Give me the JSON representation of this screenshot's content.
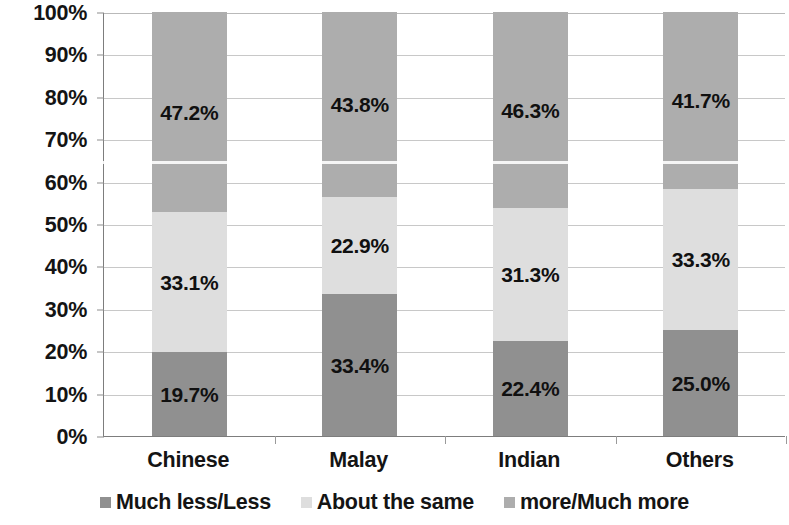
{
  "chart_data": {
    "type": "bar",
    "subtype": "stacked-100-percent",
    "title": "",
    "subtitle": "",
    "xlabel": "",
    "ylabel": "",
    "ylim": [
      0,
      100
    ],
    "y_tick_labels": [
      "0%",
      "10%",
      "20%",
      "30%",
      "40%",
      "50%",
      "60%",
      "70%",
      "80%",
      "90%",
      "100%"
    ],
    "y_tick_values": [
      0,
      10,
      20,
      30,
      40,
      50,
      60,
      70,
      80,
      90,
      100
    ],
    "grid": true,
    "legend_position": "bottom",
    "categories": [
      "Chinese",
      "Malay",
      "Indian",
      "Others"
    ],
    "series": [
      {
        "name": "Much less/Less",
        "color": "#909090",
        "values": [
          19.7,
          33.4,
          22.4,
          25.0
        ],
        "labels": [
          "19.7%",
          "33.4%",
          "22.4%",
          "25.0%"
        ]
      },
      {
        "name": "About the same",
        "color": "#dedede",
        "values": [
          33.1,
          22.9,
          31.3,
          33.3
        ],
        "labels": [
          "33.1%",
          "22.9%",
          "31.3%",
          "33.3%"
        ]
      },
      {
        "name": "more/Much more",
        "color": "#adadad",
        "values": [
          47.2,
          43.8,
          46.3,
          41.7
        ],
        "labels": [
          "47.2%",
          "43.8%",
          "46.3%",
          "41.7%"
        ]
      }
    ]
  },
  "colors": {
    "axis": "#7d7d7d",
    "gridline": "#c8c8c8",
    "text": "#141414",
    "background": "#ffffff"
  }
}
